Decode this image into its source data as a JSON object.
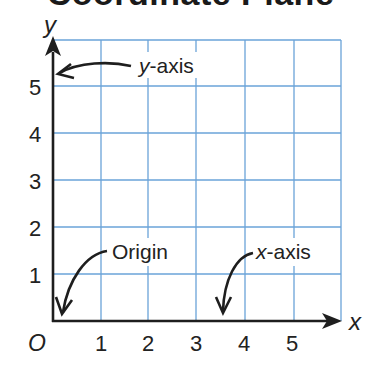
{
  "title": "Coordinate Plane",
  "axes": {
    "x_label": "x",
    "y_label": "y",
    "origin_label": "O",
    "x_ticks": [
      "1",
      "2",
      "3",
      "4",
      "5"
    ],
    "y_ticks": [
      "1",
      "2",
      "3",
      "4",
      "5"
    ]
  },
  "callouts": {
    "y_axis": {
      "var": "y",
      "rest": "-axis"
    },
    "origin": {
      "text": "Origin"
    },
    "x_axis": {
      "var": "x",
      "rest": "-axis"
    }
  },
  "colors": {
    "grid": "#6aa3d8",
    "axis": "#1e1e1e",
    "text": "#222222",
    "background": "#ffffff"
  },
  "grid": {
    "columns": 6,
    "rows": 6
  }
}
